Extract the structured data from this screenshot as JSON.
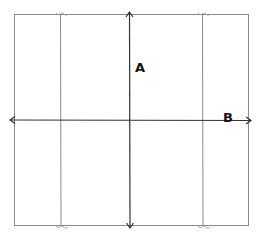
{
  "diagram": {
    "labels": {
      "vertical_arrow": "A",
      "horizontal_arrow": "B"
    },
    "colors": {
      "outline": "#8a8a8a",
      "arrow": "#333333",
      "label": "#111111"
    }
  }
}
